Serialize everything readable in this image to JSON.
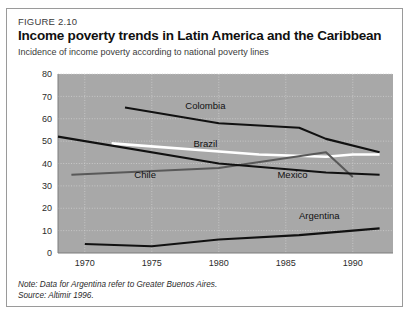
{
  "figure": {
    "number_label": "FIGURE 2.10",
    "title": "Income poverty trends in Latin America and the Caribbean",
    "subtitle": "Incidence of income poverty according to national poverty lines",
    "note": "Note: Data for Argentina refer to Greater Buenos Aires.",
    "source": "Source: Altimir 1996."
  },
  "colors": {
    "plot_background": "#a8a8a8",
    "gridline": "#cfcfcf",
    "axis": "#7d7d7d",
    "series_black": "#111111",
    "series_white": "#ffffff",
    "series_gray": "#595959",
    "border": "#9a9a9a",
    "text": "#2b2b2b"
  },
  "chart_data": {
    "type": "line",
    "title": "Income poverty trends in Latin America and the Caribbean",
    "subtitle": "Incidence of income poverty according to national poverty lines",
    "xlabel": "",
    "ylabel": "",
    "xlim": [
      1968,
      1993
    ],
    "ylim": [
      0,
      80
    ],
    "xticks": [
      1970,
      1975,
      1980,
      1985,
      1990
    ],
    "yticks": [
      0,
      10,
      20,
      30,
      40,
      50,
      60,
      70,
      80
    ],
    "grid": true,
    "legend": "inline-labels",
    "series": [
      {
        "name": "Colombia",
        "color": "#111111",
        "label_x": 1979.0,
        "label_y": 64.5,
        "x": [
          1973,
          1980,
          1986,
          1988,
          1992
        ],
        "values": [
          65,
          58,
          56,
          51,
          45
        ]
      },
      {
        "name": "Brazil",
        "color": "#ffffff",
        "label_x": 1979.0,
        "label_y": 47.5,
        "x": [
          1972,
          1983,
          1988,
          1990,
          1992
        ],
        "values": [
          49,
          44,
          43,
          44,
          44
        ]
      },
      {
        "name": "Chile",
        "color": "#595959",
        "label_x": 1974.5,
        "label_y": 33.5,
        "x": [
          1969,
          1980,
          1988,
          1990
        ],
        "values": [
          35,
          38,
          45,
          34
        ]
      },
      {
        "name": "Mexico",
        "color": "#111111",
        "label_x": 1985.5,
        "label_y": 33.5,
        "x": [
          1968,
          1980,
          1988,
          1992
        ],
        "values": [
          52,
          40,
          36,
          35
        ]
      },
      {
        "name": "Argentina",
        "color": "#111111",
        "label_x": 1987.5,
        "label_y": 15.0,
        "x": [
          1970,
          1975,
          1980,
          1986,
          1992
        ],
        "values": [
          4,
          3,
          6,
          8,
          11
        ]
      }
    ]
  }
}
